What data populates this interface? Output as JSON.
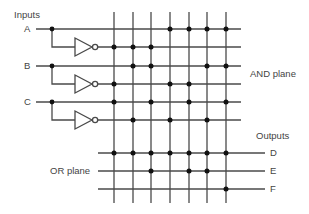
{
  "diagram": {
    "title_inputs": "Inputs",
    "label_and_plane": "AND plane",
    "label_or_plane": "OR plane",
    "title_outputs": "Outputs",
    "colors": {
      "line": "#4a4a4a",
      "dot": "#111111",
      "text": "#444444"
    },
    "inputs": [
      {
        "name": "A",
        "y": 29,
        "inv_y": 47
      },
      {
        "name": "B",
        "y": 66,
        "inv_y": 84
      },
      {
        "name": "C",
        "y": 102,
        "inv_y": 120
      }
    ],
    "outputs": [
      {
        "name": "D",
        "y": 153
      },
      {
        "name": "E",
        "y": 171
      },
      {
        "name": "F",
        "y": 189
      }
    ],
    "columns_x": [
      114,
      133,
      151,
      170,
      189,
      207,
      226
    ],
    "and_plane_rows": [
      {
        "row": "A",
        "y": 29,
        "dots": [
          4,
          5,
          6,
          7
        ]
      },
      {
        "row": "A'",
        "y": 47,
        "dots": [
          1,
          2,
          3
        ]
      },
      {
        "row": "B",
        "y": 66,
        "dots": [
          2,
          3,
          6,
          7
        ]
      },
      {
        "row": "B'",
        "y": 84,
        "dots": [
          1,
          4,
          5
        ]
      },
      {
        "row": "C",
        "y": 102,
        "dots": [
          1,
          3,
          5,
          7
        ]
      },
      {
        "row": "C'",
        "y": 120,
        "dots": [
          2,
          4,
          6
        ]
      }
    ],
    "or_plane_rows": [
      {
        "row": "D",
        "y": 153,
        "dots": [
          1,
          2,
          3,
          4,
          5,
          6,
          7
        ]
      },
      {
        "row": "E",
        "y": 171,
        "dots": [
          3,
          5,
          6
        ]
      },
      {
        "row": "F",
        "y": 189,
        "dots": [
          7
        ]
      }
    ]
  }
}
